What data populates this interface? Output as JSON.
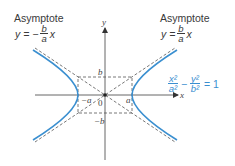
{
  "left_label": {
    "title": "Asymptote",
    "lhs": "y =",
    "sign": "−",
    "num": "b",
    "den": "a",
    "var": "x"
  },
  "right_label": {
    "title": "Asymptote",
    "lhs": "y =",
    "num": "b",
    "den": "a",
    "var": "x"
  },
  "equation": {
    "n1": "x²",
    "d1": "a²",
    "op": "−",
    "n2": "y²",
    "d2": "b²",
    "rhs": "= 1",
    "color": "#3a8fd0"
  },
  "axes": {
    "x": "x",
    "y": "y"
  },
  "ticks": {
    "b": "b",
    "neg_b": "−b",
    "a": "a",
    "neg_a": "−a",
    "origin": "0"
  },
  "colors": {
    "curve": "#3a8fd0",
    "axis": "#555555",
    "dash": "#555555"
  }
}
